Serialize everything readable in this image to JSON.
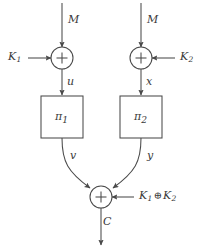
{
  "diagram": {
    "stroke_color": "#4a4a4a",
    "text_color": "#3a3a3a",
    "background": "#ffffff",
    "nodes": {
      "xor_left": {
        "name": "xor-left",
        "symbol": "+",
        "cx": 62,
        "cy": 58,
        "r": 11
      },
      "xor_right": {
        "name": "xor-right",
        "symbol": "+",
        "cx": 141,
        "cy": 58,
        "r": 11
      },
      "xor_bottom": {
        "name": "xor-bottom",
        "symbol": "+",
        "cx": 101,
        "cy": 197,
        "r": 11
      },
      "box_left": {
        "name": "permutation-box-left",
        "label": "π",
        "subscript": "1",
        "x": 41,
        "y": 96,
        "w": 42,
        "h": 42
      },
      "box_right": {
        "name": "permutation-box-right",
        "label": "π",
        "subscript": "2",
        "x": 120,
        "y": 96,
        "w": 42,
        "h": 42
      }
    },
    "labels": {
      "m_left": "M",
      "m_right": "M",
      "k1": "K",
      "k1_sub": "1",
      "k2": "K",
      "k2_sub": "2",
      "u": "u",
      "x": "x",
      "v": "v",
      "y": "y",
      "c": "C",
      "key_xor_left": "K",
      "key_xor_left_sub": "1",
      "key_xor_op": "⊕",
      "key_xor_right": "K",
      "key_xor_right_sub": "2"
    }
  }
}
